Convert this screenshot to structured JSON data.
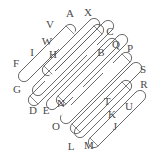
{
  "figure": {
    "type": "knot-diagram",
    "width": 164,
    "height": 161,
    "background_color": "#ffffff",
    "stroke_color": "#555555",
    "label_color": "#4a4a4a",
    "label_font_size": 11,
    "strand_count": 8,
    "crossing_count": 24
  },
  "labels": [
    {
      "text": "A",
      "x": 70,
      "y": 13
    },
    {
      "text": "X",
      "x": 88,
      "y": 12
    },
    {
      "text": "V",
      "x": 50,
      "y": 24
    },
    {
      "text": "C",
      "x": 110,
      "y": 31
    },
    {
      "text": "W",
      "x": 47,
      "y": 41
    },
    {
      "text": "Q",
      "x": 116,
      "y": 44
    },
    {
      "text": "P",
      "x": 130,
      "y": 48
    },
    {
      "text": "I",
      "x": 32,
      "y": 52
    },
    {
      "text": "H",
      "x": 53,
      "y": 54
    },
    {
      "text": "B",
      "x": 101,
      "y": 52
    },
    {
      "text": "F",
      "x": 16,
      "y": 63
    },
    {
      "text": "S",
      "x": 143,
      "y": 69
    },
    {
      "text": "R",
      "x": 144,
      "y": 84
    },
    {
      "text": "G",
      "x": 17,
      "y": 89
    },
    {
      "text": "T",
      "x": 107,
      "y": 101
    },
    {
      "text": "U",
      "x": 129,
      "y": 106
    },
    {
      "text": "N",
      "x": 61,
      "y": 103
    },
    {
      "text": "D",
      "x": 33,
      "y": 110
    },
    {
      "text": "E",
      "x": 46,
      "y": 110
    },
    {
      "text": "K",
      "x": 112,
      "y": 114
    },
    {
      "text": "O",
      "x": 56,
      "y": 126
    },
    {
      "text": "J",
      "x": 115,
      "y": 126
    },
    {
      "text": "L",
      "x": 71,
      "y": 146
    },
    {
      "text": "M",
      "x": 89,
      "y": 145
    }
  ]
}
